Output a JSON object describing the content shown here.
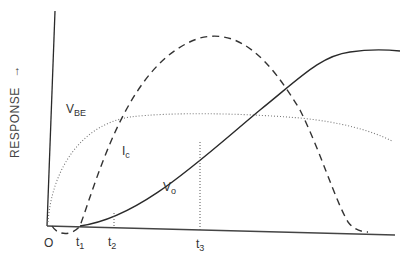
{
  "diagram": {
    "y_axis_label": "RESPONSE",
    "y_axis_arrow": "→",
    "origin_label": "O",
    "time_markers": [
      {
        "main": "t",
        "sub": "1"
      },
      {
        "main": "t",
        "sub": "2"
      },
      {
        "main": "t",
        "sub": "3"
      }
    ],
    "curves": [
      {
        "name": "V",
        "sub": "BE",
        "style": "dotted"
      },
      {
        "name": "I",
        "sub": "c",
        "style": "dashed"
      },
      {
        "name": "V",
        "sub": "o",
        "style": "solid"
      }
    ],
    "colors": {
      "line": "#2a2a2a",
      "dotted": "#777777",
      "background": "#ffffff"
    }
  }
}
